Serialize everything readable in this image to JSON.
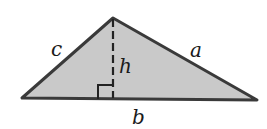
{
  "diagram": {
    "type": "triangle-with-altitude",
    "colors": {
      "fill": "#c9c9c9",
      "stroke": "#3a3a3a",
      "label": "#1a1a1a"
    },
    "vertices": {
      "apex": [
        113,
        18
      ],
      "left": [
        22,
        98
      ],
      "right": [
        257,
        100
      ]
    },
    "labels": {
      "side_c": "c",
      "side_a": "a",
      "height": "h",
      "base": "b"
    },
    "right_angle_marker": true,
    "altitude_style": "dashed"
  }
}
